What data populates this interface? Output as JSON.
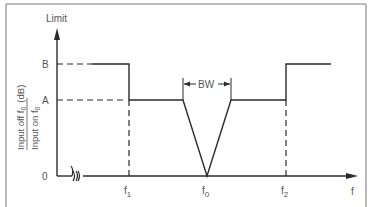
{
  "diagram": {
    "y_axis_label": "Limit",
    "x_axis_label": "f",
    "y_ticks": {
      "B": "B",
      "A": "A",
      "zero": "0"
    },
    "x_ticks": {
      "f1": {
        "base": "f",
        "sub": "1"
      },
      "f0": {
        "base": "f",
        "sub": "0"
      },
      "f2": {
        "base": "f",
        "sub": "2"
      }
    },
    "ratio_label": {
      "numerator": "Input off f",
      "numerator_sub": "0",
      "unit": "(dB)",
      "denominator": "Input on f",
      "denominator_sub": "0"
    },
    "bandwidth_label": "BW",
    "axis_break_symbol": "≈",
    "colors": {
      "line": "#2a2a2a",
      "text": "#555555",
      "border": "#777777"
    }
  }
}
